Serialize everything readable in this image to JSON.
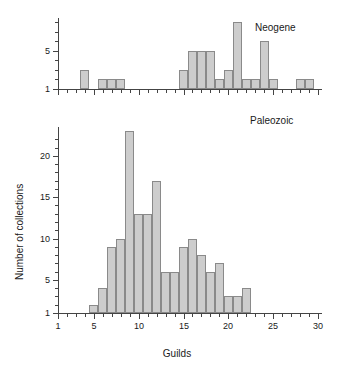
{
  "figure": {
    "xlabel": "Guilds",
    "ylabel": "Number of collections",
    "background": "#ffffff",
    "bar_fill": "#cdcdcd",
    "bar_stroke": "#8a8a8a",
    "axis_color": "#444444"
  },
  "panels": {
    "top": {
      "title": "Neogene"
    },
    "bottom": {
      "title": "Paleozoic"
    }
  },
  "chart_data": [
    {
      "type": "bar",
      "title": "Neogene",
      "xlabel": "Guilds",
      "ylabel": "Number of collections",
      "xlim": [
        1,
        30
      ],
      "ylim": [
        1,
        8
      ],
      "xticks": [
        1,
        5,
        10,
        15,
        20,
        25,
        30
      ],
      "xtick_labels": [
        "1",
        "5",
        "10",
        "15",
        "20",
        "25",
        "30"
      ],
      "yticks": [
        1,
        2,
        3,
        4,
        5,
        6,
        7,
        8
      ],
      "ytick_labels": [
        "1",
        "",
        "",
        "",
        "5",
        "",
        "",
        ""
      ],
      "grid": false,
      "legend": false,
      "categories": [
        1,
        2,
        3,
        4,
        5,
        6,
        7,
        8,
        9,
        10,
        11,
        12,
        13,
        14,
        15,
        16,
        17,
        18,
        19,
        20,
        21,
        22,
        23,
        24,
        25,
        26,
        27,
        28,
        29,
        30
      ],
      "values": [
        0,
        0,
        0,
        3,
        1,
        2,
        2,
        2,
        0,
        1,
        0,
        1,
        0,
        1,
        3,
        5,
        5,
        5,
        2,
        3,
        8,
        2,
        2,
        6,
        2,
        1,
        1,
        2,
        2,
        1
      ]
    },
    {
      "type": "bar",
      "title": "Paleozoic",
      "xlabel": "Guilds",
      "ylabel": "Number of collections",
      "xlim": [
        1,
        30
      ],
      "ylim": [
        1,
        23
      ],
      "xticks": [
        1,
        5,
        10,
        15,
        20,
        25,
        30
      ],
      "xtick_labels": [
        "1",
        "5",
        "10",
        "15",
        "20",
        "25",
        "30"
      ],
      "yticks": [
        1,
        2,
        3,
        4,
        5,
        6,
        7,
        8,
        9,
        10,
        11,
        12,
        13,
        14,
        15,
        16,
        17,
        18,
        19,
        20,
        21,
        22
      ],
      "ytick_labels": [
        "1",
        "",
        "",
        "",
        "5",
        "",
        "",
        "",
        "",
        "10",
        "",
        "",
        "",
        "",
        "15",
        "",
        "",
        "",
        "",
        "20",
        "",
        ""
      ],
      "grid": false,
      "legend": false,
      "categories": [
        1,
        2,
        3,
        4,
        5,
        6,
        7,
        8,
        9,
        10,
        11,
        12,
        13,
        14,
        15,
        16,
        17,
        18,
        19,
        20,
        21,
        22,
        23,
        24,
        25,
        26,
        27,
        28,
        29,
        30
      ],
      "values": [
        0,
        0,
        0,
        0,
        2,
        4,
        9,
        10,
        23,
        13,
        13,
        17,
        6,
        6,
        9,
        10,
        8,
        6,
        7,
        3,
        3,
        4,
        0,
        0,
        0,
        0,
        0,
        0,
        0,
        0
      ]
    }
  ]
}
